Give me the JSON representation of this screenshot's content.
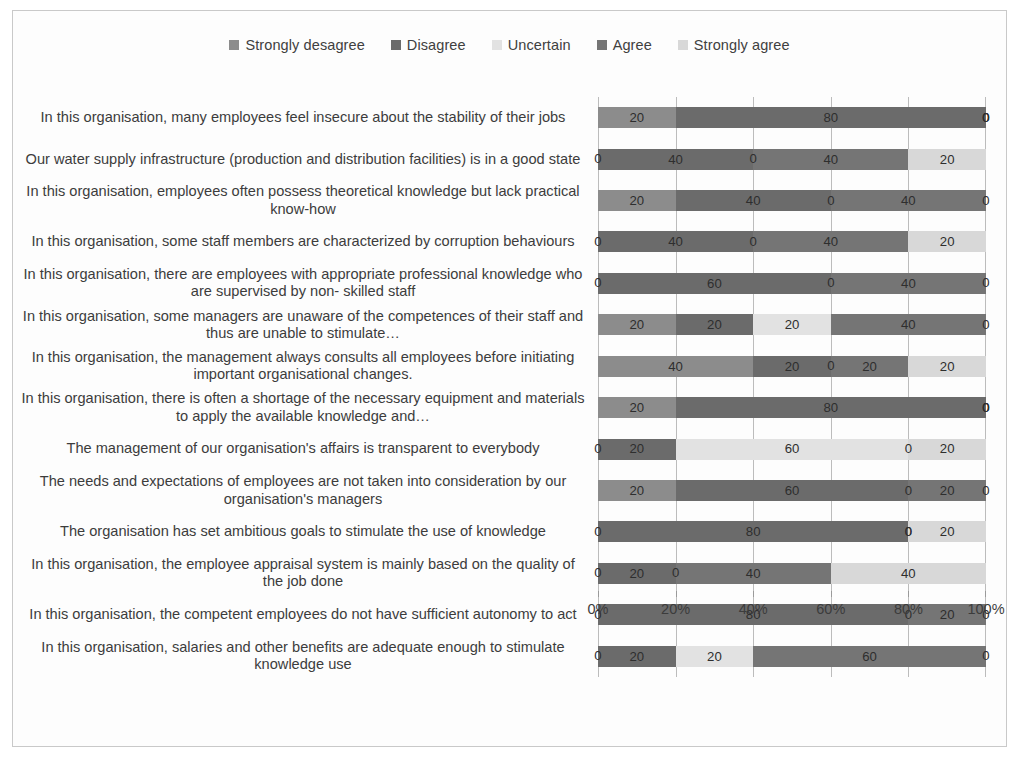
{
  "chart_data": {
    "type": "bar",
    "subtype": "100% stacked horizontal bar",
    "title": "",
    "xlabel": "",
    "ylabel": "",
    "xlim": [
      0,
      100
    ],
    "grid": true,
    "legend_position": "top-center",
    "x_tick_labels": [
      "0%",
      "20%",
      "40%",
      "60%",
      "80%",
      "100%"
    ],
    "x_ticks": [
      0,
      20,
      40,
      60,
      80,
      100
    ],
    "series": [
      {
        "name": "Strongly desagree",
        "color": "#8c8c8c",
        "values": [
          20,
          0,
          20,
          0,
          0,
          20,
          40,
          20,
          0,
          20,
          0,
          0,
          0,
          0
        ]
      },
      {
        "name": "Disagree",
        "color": "#6b6b6b",
        "values": [
          80,
          40,
          40,
          40,
          60,
          20,
          20,
          80,
          20,
          60,
          80,
          20,
          80,
          20
        ]
      },
      {
        "name": "Uncertain",
        "color": "#e2e2e2",
        "values": [
          0,
          0,
          0,
          0,
          0,
          20,
          0,
          0,
          60,
          0,
          0,
          0,
          0,
          20
        ]
      },
      {
        "name": "Agree",
        "color": "#757575",
        "values": [
          0,
          40,
          40,
          40,
          40,
          40,
          20,
          0,
          0,
          20,
          0,
          40,
          20,
          60
        ]
      },
      {
        "name": "Strongly agree",
        "color": "#d8d8d8",
        "values": [
          0,
          20,
          0,
          20,
          0,
          0,
          20,
          0,
          20,
          0,
          20,
          40,
          0,
          0
        ]
      }
    ],
    "categories": [
      "In this organisation, many employees feel insecure about the stability of their jobs",
      "Our water supply infrastructure (production and distribution facilities) is in a good state",
      "In this organisation, employees often possess theoretical knowledge but lack practical know-how",
      "In this organisation, some staff members are characterized by corruption behaviours",
      "In this organisation, there are employees with appropriate professional knowledge who are supervised by non- skilled staff",
      "In this organisation, some managers are unaware of the competences of their staff and thus are unable to stimulate…",
      "In this organisation, the management always consults all employees before initiating important organisational changes.",
      "In this organisation, there is often a shortage of the necessary equipment and materials to apply the available knowledge and…",
      "The management of our organisation's affairs is transparent to everybody",
      "The needs and expectations of employees are not taken into consideration by our organisation's managers",
      "The organisation has set ambitious goals to stimulate the use of knowledge",
      "In this organisation, the employee appraisal system  is mainly based on the quality of the job done",
      "In this organisation, the competent employees do not have sufficient autonomy to act",
      "In this organisation, salaries and other benefits are adequate enough to stimulate knowledge use"
    ],
    "rows": [
      {
        "label": "In this organisation, many employees feel insecure about the stability of their jobs",
        "segments": [
          20,
          80,
          0,
          0,
          0
        ]
      },
      {
        "label": "Our water supply infrastructure (production and distribution facilities) is in a good state",
        "segments": [
          0,
          40,
          0,
          40,
          20
        ]
      },
      {
        "label": "In this organisation, employees often possess theoretical knowledge but lack practical know-how",
        "segments": [
          20,
          40,
          0,
          40,
          0
        ]
      },
      {
        "label": "In this organisation, some staff members are characterized by corruption behaviours",
        "segments": [
          0,
          40,
          0,
          40,
          20
        ]
      },
      {
        "label": "In this organisation, there are employees with appropriate professional knowledge who are supervised by non- skilled staff",
        "segments": [
          0,
          60,
          0,
          40,
          0
        ]
      },
      {
        "label": "In this organisation, some managers are unaware of the competences of their staff and thus are unable to stimulate…",
        "segments": [
          20,
          20,
          20,
          40,
          0
        ]
      },
      {
        "label": "In this organisation, the management always consults all employees before initiating important organisational changes.",
        "segments": [
          40,
          20,
          0,
          20,
          20
        ]
      },
      {
        "label": "In this organisation, there is often a shortage of the necessary equipment and materials to apply the available knowledge and…",
        "segments": [
          20,
          80,
          0,
          0,
          0
        ]
      },
      {
        "label": "The management of our organisation's affairs is transparent to everybody",
        "segments": [
          0,
          20,
          60,
          0,
          20
        ]
      },
      {
        "label": "The needs and expectations of employees are not taken into consideration by our organisation's managers",
        "segments": [
          20,
          60,
          0,
          20,
          0
        ]
      },
      {
        "label": "The organisation has set ambitious goals to stimulate the use of knowledge",
        "segments": [
          0,
          80,
          0,
          0,
          20
        ]
      },
      {
        "label": "In this organisation, the employee appraisal system  is mainly based on the quality of the job done",
        "segments": [
          0,
          20,
          0,
          40,
          40
        ]
      },
      {
        "label": "In this organisation, the competent employees do not have sufficient autonomy to act",
        "segments": [
          0,
          80,
          0,
          20,
          0
        ]
      },
      {
        "label": "In this organisation, salaries and other benefits are adequate enough to stimulate knowledge use",
        "segments": [
          0,
          20,
          20,
          60,
          0
        ]
      }
    ]
  },
  "colors": {
    "strongly_desagree": "#8c8c8c",
    "disagree": "#6b6b6b",
    "uncertain": "#e2e2e2",
    "agree": "#757575",
    "strongly_agree": "#d8d8d8",
    "gridline": "#bcbcbc",
    "frame": "#c9c9c9",
    "text": "#3c3c3c"
  }
}
